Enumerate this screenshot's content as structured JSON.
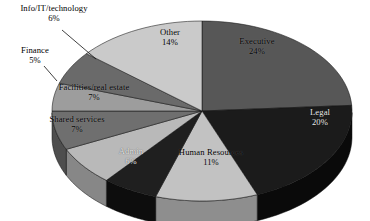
{
  "chart_data": {
    "type": "pie",
    "title": "",
    "subtitle": "",
    "xlabel": "",
    "ylabel": "",
    "legend_position": "none",
    "grid": false,
    "value_unit": "percent",
    "three_d": true,
    "categories": [
      "Executive",
      "Legal",
      "Human Resources",
      "Admin",
      "Shared services",
      "Facilities/real estate",
      "Finance",
      "Info/IT/technology",
      "Other"
    ],
    "values": [
      24,
      20,
      11,
      6,
      7,
      7,
      5,
      6,
      14
    ],
    "slices": [
      {
        "label": "Executive",
        "value": 24,
        "value_text": "24%",
        "color": "#575757",
        "side_color": "#3c3c3c",
        "label_placement": "inside",
        "label_style": "dark"
      },
      {
        "label": "Legal",
        "value": 20,
        "value_text": "20%",
        "color": "#1b1b1b",
        "side_color": "#0a0a0a",
        "label_placement": "inside",
        "label_style": "light"
      },
      {
        "label": "Human Resources",
        "value": 11,
        "value_text": "11%",
        "color": "#c2c2c2",
        "side_color": "#8e8e8e",
        "label_placement": "inside",
        "label_style": "dark"
      },
      {
        "label": "Admin",
        "value": 6,
        "value_text": "6%",
        "color": "#1f1f1f",
        "side_color": "#0d0d0d",
        "label_placement": "inside",
        "label_style": "light"
      },
      {
        "label": "Shared services",
        "value": 7,
        "value_text": "7%",
        "color": "#b9b9b9",
        "side_color": "#878787",
        "label_placement": "inside",
        "label_style": "dark"
      },
      {
        "label": "Facilities/real estate",
        "value": 7,
        "value_text": "7%",
        "color": "#6f6f6f",
        "side_color": "#4e4e4e",
        "label_placement": "inside",
        "label_style": "dark"
      },
      {
        "label": "Finance",
        "value": 5,
        "value_text": "5%",
        "color": "#9d9d9d",
        "side_color": "#717171",
        "label_placement": "outside",
        "label_style": "out"
      },
      {
        "label": "Info/IT/technology",
        "value": 6,
        "value_text": "6%",
        "color": "#6a6a6a",
        "side_color": "#4a4a4a",
        "label_placement": "outside",
        "label_style": "out"
      },
      {
        "label": "Other",
        "value": 14,
        "value_text": "14%",
        "color": "#cacaca",
        "side_color": "#959595",
        "label_placement": "inside",
        "label_style": "dark"
      }
    ]
  },
  "labels": {
    "executive": {
      "name": "Executive",
      "percent": "24%"
    },
    "legal": {
      "name": "Legal",
      "percent": "20%"
    },
    "hr": {
      "name": "Human Resources",
      "percent": "11%"
    },
    "admin": {
      "name": "Admin",
      "percent": "6%"
    },
    "shared": {
      "name": "Shared services",
      "percent": "7%"
    },
    "facilities": {
      "name": "Facilities/real estate",
      "percent": "7%"
    },
    "finance": {
      "name": "Finance",
      "percent": "5%"
    },
    "infoit": {
      "name": "Info/IT/technology",
      "percent": "6%"
    },
    "other": {
      "name": "Other",
      "percent": "14%"
    }
  }
}
